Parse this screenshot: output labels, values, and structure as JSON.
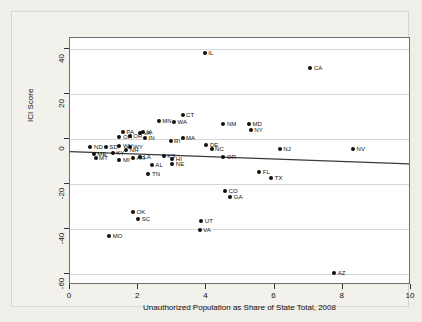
{
  "chart_data": {
    "type": "scatter",
    "title": "",
    "xlabel": "Unauthorized Population as Share of State Total, 2008",
    "ylabel": "ICI Score",
    "xlim": [
      0,
      10
    ],
    "ylim": [
      -65,
      45
    ],
    "xticks": [
      0,
      2,
      4,
      6,
      8,
      10
    ],
    "xtick_labels": [
      "0",
      "2",
      "4",
      "6",
      "8",
      "10"
    ],
    "yticks": [
      40,
      20,
      0,
      -20,
      -40,
      -60
    ],
    "ytick_labels": [
      "40",
      "20",
      "0",
      "-20",
      "-40",
      "-60"
    ],
    "grid": "horizontal",
    "legend": "none",
    "marker_color": "#101010",
    "fit_line": {
      "label": "linear fit",
      "color": "#3a3a3a",
      "x_start": 0.0,
      "y_start": -6.0,
      "x_end": 10.0,
      "y_end": -11.5
    },
    "points": [
      {
        "label": "IL",
        "x": 3.95,
        "y": 38.5
      },
      {
        "label": "CA",
        "x": 7.05,
        "y": 31.5
      },
      {
        "label": "CT",
        "x": 3.3,
        "y": 10.5
      },
      {
        "label": "MN",
        "x": 2.6,
        "y": 8.0
      },
      {
        "label": "WA",
        "x": 3.05,
        "y": 7.5
      },
      {
        "label": "NM",
        "x": 4.5,
        "y": 6.5
      },
      {
        "label": "MD",
        "x": 5.25,
        "y": 6.5
      },
      {
        "label": "NY",
        "x": 5.3,
        "y": 4.0
      },
      {
        "label": "PA",
        "x": 1.55,
        "y": 3.0
      },
      {
        "label": "IA",
        "x": 2.15,
        "y": 3.0
      },
      {
        "label": "VA",
        "x": 2.05,
        "y": 2.5
      },
      {
        "label": "OR",
        "x": 1.75,
        "y": 1.5
      },
      {
        "label": "IN",
        "x": 2.2,
        "y": 0.5
      },
      {
        "label": "MA",
        "x": 3.3,
        "y": 0.5
      },
      {
        "label": "RI",
        "x": 2.95,
        "y": -1.0
      },
      {
        "label": "DE",
        "x": 4.0,
        "y": -2.5
      },
      {
        "label": "NC",
        "x": 4.15,
        "y": -4.5
      },
      {
        "label": "NJ",
        "x": 6.15,
        "y": -4.5
      },
      {
        "label": "NV",
        "x": 8.3,
        "y": -4.5
      },
      {
        "label": "ND",
        "x": 0.6,
        "y": -3.5
      },
      {
        "label": "SD",
        "x": 1.05,
        "y": -3.5
      },
      {
        "label": "WV",
        "x": 1.45,
        "y": -3.0
      },
      {
        "label": "WY",
        "x": 1.75,
        "y": -3.5
      },
      {
        "label": "OH",
        "x": 1.45,
        "y": 1.0
      },
      {
        "label": "ME",
        "x": 0.7,
        "y": -6.5
      },
      {
        "label": "KY",
        "x": 1.25,
        "y": -6.0
      },
      {
        "label": "NH",
        "x": 1.65,
        "y": -5.0
      },
      {
        "label": "MT",
        "x": 0.75,
        "y": -8.5
      },
      {
        "label": "MI",
        "x": 1.45,
        "y": -9.5
      },
      {
        "label": "AR",
        "x": 1.85,
        "y": -8.5
      },
      {
        "label": "LA",
        "x": 2.05,
        "y": -8.0
      },
      {
        "label": "KS",
        "x": 2.75,
        "y": -7.5
      },
      {
        "label": "HI",
        "x": 3.0,
        "y": -9.0
      },
      {
        "label": "OR2",
        "x": 4.5,
        "y": -8.0
      },
      {
        "label": "AL",
        "x": 2.4,
        "y": -11.5
      },
      {
        "label": "NE",
        "x": 3.0,
        "y": -11.0
      },
      {
        "label": "TN",
        "x": 2.3,
        "y": -15.5
      },
      {
        "label": "FL",
        "x": 5.55,
        "y": -14.5
      },
      {
        "label": "TX",
        "x": 5.9,
        "y": -17.5
      },
      {
        "label": "CO",
        "x": 4.55,
        "y": -23.0
      },
      {
        "label": "GA",
        "x": 4.7,
        "y": -26.0
      },
      {
        "label": "OK",
        "x": 1.85,
        "y": -32.5
      },
      {
        "label": "SC",
        "x": 2.0,
        "y": -35.5
      },
      {
        "label": "MO",
        "x": 1.15,
        "y": -43.0
      },
      {
        "label": "UT",
        "x": 3.85,
        "y": -36.5
      },
      {
        "label": "VA2",
        "x": 3.8,
        "y": -40.5
      },
      {
        "label": "AZ",
        "x": 7.75,
        "y": -59.5
      }
    ],
    "point_label_text": {
      "OR2": "OR",
      "VA2": "VA"
    }
  }
}
